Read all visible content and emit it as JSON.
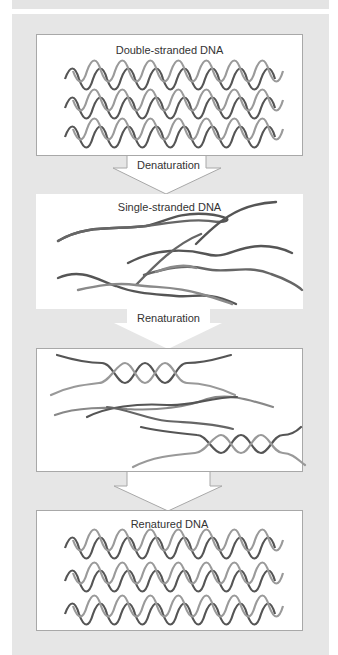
{
  "figure": {
    "colors": {
      "panel_background": "#e6e6e6",
      "box_background": "#ffffff",
      "box_border": "#a8a8a8",
      "strand_dark": "#555555",
      "strand_light": "#9a9a9a",
      "text": "#333333"
    },
    "stages": [
      {
        "label": "Double-stranded DNA",
        "illustration": "three-double-helices"
      },
      {
        "label": "Single-stranded DNA",
        "illustration": "separated-single-strands"
      },
      {
        "label": "",
        "illustration": "partially-reannealed-strands"
      },
      {
        "label": "Renatured DNA",
        "illustration": "three-double-helices"
      }
    ],
    "transitions": [
      {
        "label": "Denaturation"
      },
      {
        "label": "Renaturation"
      },
      {
        "label": ""
      }
    ]
  }
}
